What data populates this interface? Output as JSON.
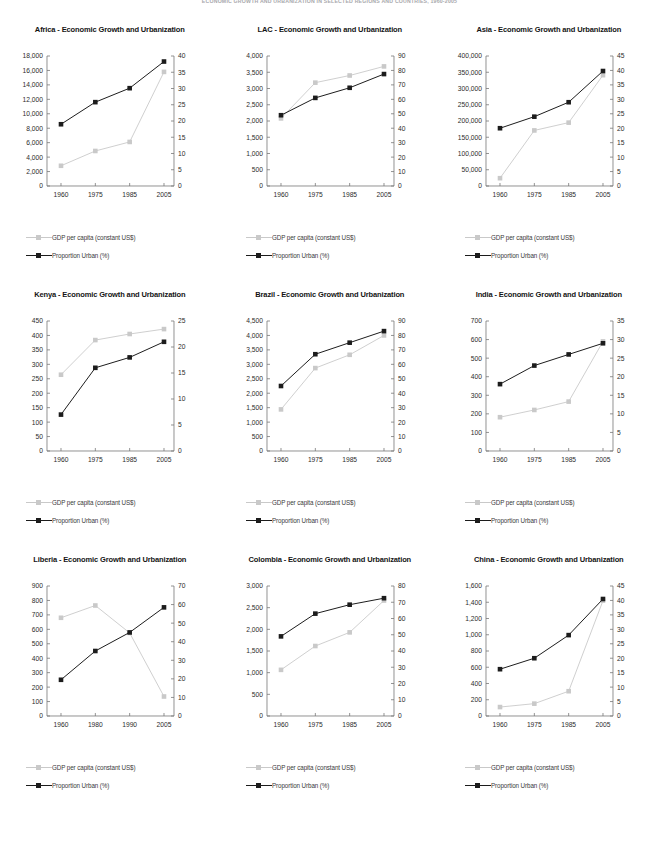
{
  "header": {
    "text": "ECONOMIC GROWTH AND URBANIZATION IN SELECTED REGIONS AND COUNTRIES, 1960-2005"
  },
  "legend": {
    "gdp_label": "GDP per capita (constant US$)",
    "urban_label": "Proportion Urban (%)",
    "gdp_color": "#c9c9c9",
    "urban_color": "#1c1c1c"
  },
  "chart_data": [
    {
      "type": "line",
      "title": "Africa - Economic Growth and Urbanization",
      "categories": [
        "1960",
        "1975",
        "1985",
        "2005"
      ],
      "xlabel": "",
      "ylabel": "",
      "ylim": [
        0,
        18000
      ],
      "yticks": [
        0,
        2000,
        4000,
        6000,
        8000,
        10000,
        12000,
        14000,
        16000,
        18000
      ],
      "ytick_labels": [
        "0",
        "2,000",
        "4,000",
        "6,000",
        "8,000",
        "10,000",
        "12,000",
        "14,000",
        "16,000",
        "18,000"
      ],
      "y2lim": [
        0,
        40
      ],
      "y2ticks": [
        0,
        5,
        10,
        15,
        20,
        25,
        30,
        35,
        40
      ],
      "y2tick_labels": [
        "0",
        "5",
        "10",
        "15",
        "20",
        "25",
        "30",
        "35",
        "40"
      ],
      "series": [
        {
          "name": "GDP per capita (constant US$)",
          "axis": "left",
          "values": [
            2800,
            4850,
            6100,
            15800
          ]
        },
        {
          "name": "Proportion Urban (%)",
          "axis": "right",
          "values": [
            19.0,
            25.8,
            30.1,
            38.3
          ]
        }
      ]
    },
    {
      "type": "line",
      "title": "LAC - Economic Growth and Urbanization",
      "categories": [
        "1960",
        "1975",
        "1985",
        "2005"
      ],
      "xlabel": "",
      "ylabel": "",
      "ylim": [
        0,
        4000
      ],
      "yticks": [
        0,
        500,
        1000,
        1500,
        2000,
        2500,
        3000,
        3500,
        4000
      ],
      "ytick_labels": [
        "0",
        "500",
        "1,000",
        "1,500",
        "2,000",
        "2,500",
        "3,000",
        "3,500",
        "4,000"
      ],
      "y2lim": [
        0,
        90
      ],
      "y2ticks": [
        0,
        10,
        20,
        30,
        40,
        50,
        60,
        70,
        80,
        90
      ],
      "y2tick_labels": [
        "0",
        "10",
        "20",
        "30",
        "40",
        "50",
        "60",
        "70",
        "80",
        "90"
      ],
      "series": [
        {
          "name": "GDP per capita (constant US$)",
          "axis": "left",
          "values": [
            2080,
            3180,
            3400,
            3680
          ]
        },
        {
          "name": "Proportion Urban (%)",
          "axis": "right",
          "values": [
            49.0,
            61.0,
            68.0,
            77.5
          ]
        }
      ]
    },
    {
      "type": "line",
      "title": "Asia - Economic Growth and Urbanization",
      "categories": [
        "1960",
        "1975",
        "1985",
        "2005"
      ],
      "xlabel": "",
      "ylabel": "",
      "ylim": [
        0,
        400000
      ],
      "yticks": [
        0,
        50000,
        100000,
        150000,
        200000,
        250000,
        300000,
        350000,
        400000
      ],
      "ytick_labels": [
        "0",
        "50,000",
        "100,000",
        "150,000",
        "200,000",
        "250,000",
        "300,000",
        "350,000",
        "400,000"
      ],
      "y2lim": [
        0,
        45
      ],
      "y2ticks": [
        0,
        5,
        10,
        15,
        20,
        25,
        30,
        35,
        40,
        45
      ],
      "y2tick_labels": [
        "0",
        "5",
        "10",
        "15",
        "20",
        "25",
        "30",
        "35",
        "40",
        "45"
      ],
      "series": [
        {
          "name": "GDP per capita (constant US$)",
          "axis": "left",
          "values": [
            24000,
            171000,
            195000,
            341000
          ]
        },
        {
          "name": "Proportion Urban (%)",
          "axis": "right",
          "values": [
            20.0,
            24.0,
            29.0,
            39.8
          ]
        }
      ]
    },
    {
      "type": "line",
      "title": "Kenya - Economic Growth and Urbanization",
      "categories": [
        "1960",
        "1975",
        "1985",
        "2005"
      ],
      "xlabel": "",
      "ylabel": "",
      "ylim": [
        0,
        450
      ],
      "yticks": [
        0,
        50,
        100,
        150,
        200,
        250,
        300,
        350,
        400,
        450
      ],
      "ytick_labels": [
        "0",
        "50",
        "100",
        "150",
        "200",
        "250",
        "300",
        "350",
        "400",
        "450"
      ],
      "y2lim": [
        0,
        25
      ],
      "y2ticks": [
        0,
        5,
        10,
        15,
        20,
        25
      ],
      "y2tick_labels": [
        "0",
        "5",
        "10",
        "15",
        "20",
        "25"
      ],
      "series": [
        {
          "name": "GDP per capita (constant US$)",
          "axis": "left",
          "values": [
            264,
            384,
            405,
            422
          ]
        },
        {
          "name": "Proportion Urban (%)",
          "axis": "right",
          "values": [
            7.0,
            16.0,
            18.0,
            21.0
          ]
        }
      ]
    },
    {
      "type": "line",
      "title": "Brazil - Economic Growth and Urbanization",
      "categories": [
        "1960",
        "1975",
        "1985",
        "2005"
      ],
      "xlabel": "",
      "ylabel": "",
      "ylim": [
        0,
        4500
      ],
      "yticks": [
        0,
        500,
        1000,
        1500,
        2000,
        2500,
        3000,
        3500,
        4000,
        4500
      ],
      "ytick_labels": [
        "0",
        "500",
        "1,000",
        "1,500",
        "2,000",
        "2,500",
        "3,000",
        "3,500",
        "4,000",
        "4,500"
      ],
      "y2lim": [
        0,
        90
      ],
      "y2ticks": [
        0,
        10,
        20,
        30,
        40,
        50,
        60,
        70,
        80,
        90
      ],
      "y2tick_labels": [
        "0",
        "10",
        "20",
        "30",
        "40",
        "50",
        "60",
        "70",
        "80",
        "90"
      ],
      "series": [
        {
          "name": "GDP per capita (constant US$)",
          "axis": "left",
          "values": [
            1440,
            2870,
            3330,
            4000
          ]
        },
        {
          "name": "Proportion Urban (%)",
          "axis": "right",
          "values": [
            45.0,
            67.0,
            75.0,
            83.0
          ]
        }
      ]
    },
    {
      "type": "line",
      "title": "India - Economic Growth and Urbanization",
      "categories": [
        "1960",
        "1975",
        "1985",
        "2005"
      ],
      "xlabel": "",
      "ylabel": "",
      "ylim": [
        0,
        700
      ],
      "yticks": [
        0,
        100,
        200,
        300,
        400,
        500,
        600,
        700
      ],
      "ytick_labels": [
        "0",
        "100",
        "200",
        "300",
        "400",
        "500",
        "600",
        "700"
      ],
      "y2lim": [
        0,
        35
      ],
      "y2ticks": [
        0,
        5,
        10,
        15,
        20,
        25,
        30,
        35
      ],
      "y2tick_labels": [
        "0",
        "5",
        "10",
        "15",
        "20",
        "25",
        "30",
        "35"
      ],
      "series": [
        {
          "name": "GDP per capita (constant US$)",
          "axis": "left",
          "values": [
            182,
            221,
            266,
            590
          ]
        },
        {
          "name": "Proportion Urban (%)",
          "axis": "right",
          "values": [
            18.0,
            23.0,
            26.0,
            29.0
          ]
        }
      ]
    },
    {
      "type": "line",
      "title": "Liberia - Economic Growth and Urbanization",
      "categories": [
        "1960",
        "1980",
        "1990",
        "2005"
      ],
      "xlabel": "",
      "ylabel": "",
      "ylim": [
        0,
        900
      ],
      "yticks": [
        0,
        100,
        200,
        300,
        400,
        500,
        600,
        700,
        800,
        900
      ],
      "ytick_labels": [
        "0",
        "100",
        "200",
        "300",
        "400",
        "500",
        "600",
        "700",
        "800",
        "900"
      ],
      "y2lim": [
        0,
        70
      ],
      "y2ticks": [
        0,
        10,
        20,
        30,
        40,
        50,
        60,
        70
      ],
      "y2tick_labels": [
        "0",
        "10",
        "20",
        "30",
        "40",
        "50",
        "60",
        "70"
      ],
      "series": [
        {
          "name": "GDP per capita (constant US$)",
          "axis": "left",
          "values": [
            680,
            765,
            575,
            135
          ]
        },
        {
          "name": "Proportion Urban (%)",
          "axis": "right",
          "values": [
            19.5,
            35.0,
            45.0,
            58.5
          ]
        }
      ]
    },
    {
      "type": "line",
      "title": "Colombia - Economic Growth and Urbanization",
      "categories": [
        "1960",
        "1975",
        "1985",
        "2005"
      ],
      "xlabel": "",
      "ylabel": "",
      "ylim": [
        0,
        3000
      ],
      "yticks": [
        0,
        500,
        1000,
        1500,
        2000,
        2500,
        3000
      ],
      "ytick_labels": [
        "0",
        "500",
        "1,000",
        "1,500",
        "2,000",
        "2,500",
        "3,000"
      ],
      "y2lim": [
        0,
        80
      ],
      "y2ticks": [
        0,
        10,
        20,
        30,
        40,
        50,
        60,
        70,
        80
      ],
      "y2tick_labels": [
        "0",
        "10",
        "20",
        "30",
        "40",
        "50",
        "60",
        "70",
        "80"
      ],
      "series": [
        {
          "name": "GDP per capita (constant US$)",
          "axis": "left",
          "values": [
            1065,
            1615,
            1930,
            2665
          ]
        },
        {
          "name": "Proportion Urban (%)",
          "axis": "right",
          "values": [
            49.0,
            63.0,
            68.5,
            72.5
          ]
        }
      ]
    },
    {
      "type": "line",
      "title": "China - Economic Growth and Urbanization",
      "categories": [
        "1960",
        "1975",
        "1985",
        "2005"
      ],
      "xlabel": "",
      "ylabel": "",
      "ylim": [
        0,
        1600
      ],
      "yticks": [
        0,
        200,
        400,
        600,
        800,
        1000,
        1200,
        1400,
        1600
      ],
      "ytick_labels": [
        "0",
        "200",
        "400",
        "600",
        "800",
        "1,000",
        "1,200",
        "1,400",
        "1,600"
      ],
      "y2lim": [
        0,
        45
      ],
      "y2ticks": [
        0,
        5,
        10,
        15,
        20,
        25,
        30,
        35,
        40,
        45
      ],
      "y2tick_labels": [
        "0",
        "5",
        "10",
        "15",
        "20",
        "25",
        "30",
        "35",
        "40",
        "45"
      ],
      "series": [
        {
          "name": "GDP per capita (constant US$)",
          "axis": "left",
          "values": [
            110,
            152,
            305,
            1420
          ]
        },
        {
          "name": "Proportion Urban (%)",
          "axis": "right",
          "values": [
            16.2,
            20.0,
            28.0,
            40.5
          ]
        }
      ]
    }
  ]
}
